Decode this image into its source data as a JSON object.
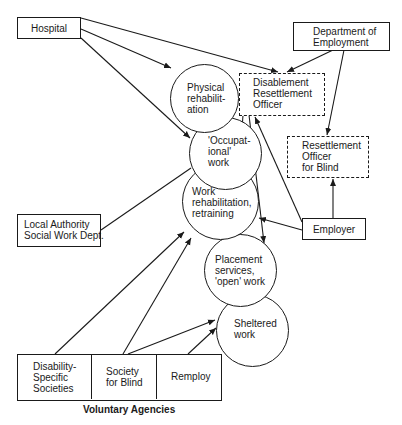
{
  "diagram": {
    "type": "flow-diagram",
    "nodes": {
      "hospital": {
        "label": "Hospital"
      },
      "dept_employment": {
        "label": "Department of\nEmployment"
      },
      "dro": {
        "label": "Disablement\nResettlement\nOfficer"
      },
      "ro_blind": {
        "label": "Resettlement\nOfficer\nfor Blind"
      },
      "local_authority": {
        "label": "Local Authority\nSocial Work Dept."
      },
      "employer": {
        "label": "Employer"
      },
      "physical_rehab": {
        "label": "Physical\nrehabilit-\nation"
      },
      "occupational_work": {
        "label": "'Occupat-\nional'\nwork"
      },
      "work_rehab": {
        "label": "Work\nrehabilitation,\nretraining"
      },
      "placement": {
        "label": "Placement\nservices,\n'open' work"
      },
      "sheltered": {
        "label": "Sheltered\nwork"
      },
      "disability_societies": {
        "label": "Disability-\nSpecific\nSocieties"
      },
      "society_blind": {
        "label": "Society\nfor Blind"
      },
      "remploy": {
        "label": "Remploy"
      }
    },
    "group_caption": "Voluntary Agencies",
    "edges": [
      {
        "from": "hospital",
        "to": "physical_rehab",
        "arrow": true
      },
      {
        "from": "hospital",
        "to": "occupational_work",
        "arrow": true
      },
      {
        "from": "hospital",
        "to": "dro",
        "arrow": true
      },
      {
        "from": "dept_employment",
        "to": "dro",
        "arrow": true
      },
      {
        "from": "dept_employment",
        "to": "ro_blind",
        "arrow": true
      },
      {
        "from": "dro",
        "to": "occupational_work",
        "arrow": true
      },
      {
        "from": "dro",
        "to": "placement",
        "arrow": true
      },
      {
        "from": "employer",
        "to": "dro",
        "arrow": true
      },
      {
        "from": "employer",
        "to": "ro_blind",
        "arrow": true
      },
      {
        "from": "employer",
        "to": "work_rehab",
        "arrow": true
      },
      {
        "from": "local_authority",
        "to": "occupational_work",
        "arrow": false
      },
      {
        "from": "disability_societies",
        "to": "work_rehab",
        "arrow": true
      },
      {
        "from": "society_blind",
        "to": "work_rehab",
        "arrow": true
      },
      {
        "from": "society_blind",
        "to": "sheltered",
        "arrow": true
      },
      {
        "from": "remploy",
        "to": "sheltered",
        "arrow": true
      }
    ]
  }
}
